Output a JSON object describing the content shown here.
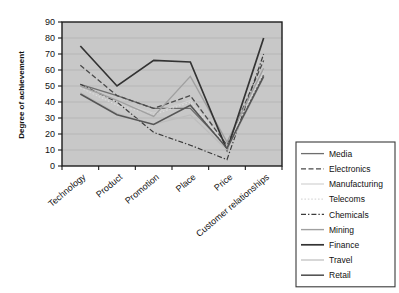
{
  "chart_data": {
    "type": "line",
    "title": "",
    "xlabel": "",
    "ylabel": "Degree of achievement",
    "ylim": [
      0,
      90
    ],
    "ytick_step": 10,
    "yticks": [
      0,
      10,
      20,
      30,
      40,
      50,
      60,
      70,
      80,
      90
    ],
    "grid": true,
    "legend_position": "right",
    "plot_background": "#c8c8c8",
    "categories": [
      "Technology",
      "Product",
      "Promotion",
      "Place",
      "Price",
      "Customer relationships"
    ],
    "series": [
      {
        "name": "Media",
        "values": [
          51,
          44,
          36,
          36,
          12,
          57
        ],
        "color": "#6e6e6e",
        "dash": "none",
        "width": 1.3
      },
      {
        "name": "Electronics",
        "values": [
          63,
          44,
          36,
          44,
          13,
          66
        ],
        "color": "#4a4a4a",
        "dash": "dashed",
        "width": 1.3
      },
      {
        "name": "Manufacturing",
        "values": [
          50,
          40,
          33,
          41,
          12,
          60
        ],
        "color": "#d2d2d2",
        "dash": "none",
        "width": 1.2
      },
      {
        "name": "Telecoms",
        "values": [
          49,
          38,
          32,
          40,
          11,
          58
        ],
        "color": "#dadada",
        "dash": "dotted",
        "width": 1.2
      },
      {
        "name": "Chemicals",
        "values": [
          51,
          40,
          21,
          13,
          4,
          70
        ],
        "color": "#3c3c3c",
        "dash": "dashdot",
        "width": 1.2
      },
      {
        "name": "Mining",
        "values": [
          50,
          41,
          31,
          56,
          15,
          61
        ],
        "color": "#a0a0a0",
        "dash": "none",
        "width": 1.4
      },
      {
        "name": "Finance",
        "values": [
          75,
          50,
          66,
          65,
          10,
          80
        ],
        "color": "#333333",
        "dash": "none",
        "width": 1.7
      },
      {
        "name": "Travel",
        "values": [
          46,
          33,
          26,
          32,
          10,
          55
        ],
        "color": "#bdbdbd",
        "dash": "none",
        "width": 1.2
      },
      {
        "name": "Retail",
        "values": [
          45,
          32,
          26,
          38,
          11,
          56
        ],
        "color": "#555555",
        "dash": "none",
        "width": 1.6
      }
    ]
  },
  "axes": {
    "y_axis_title": "Degree of achievement"
  },
  "legend": {
    "entries": [
      {
        "label": "Media"
      },
      {
        "label": "Electronics"
      },
      {
        "label": "Manufacturing"
      },
      {
        "label": "Telecoms"
      },
      {
        "label": "Chemicals"
      },
      {
        "label": "Mining"
      },
      {
        "label": "Finance"
      },
      {
        "label": "Travel"
      },
      {
        "label": "Retail"
      }
    ]
  }
}
